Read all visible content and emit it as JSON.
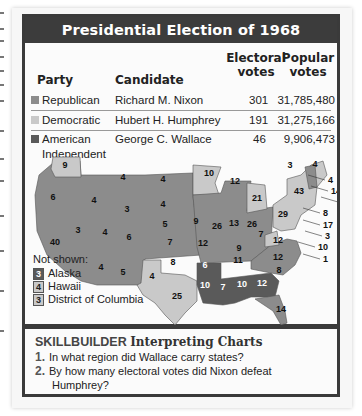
{
  "title": "Presidential Election of 1968",
  "table": {
    "headers": {
      "party": "Party",
      "candidate": "Candidate",
      "electoral_1": "Electoral",
      "electoral_2": "votes",
      "popular_1": "Popular",
      "popular_2": "votes"
    },
    "rows": [
      {
        "party": "Republican",
        "candidate": "Richard M. Nixon",
        "electoral": "301",
        "popular": "31,785,480",
        "color": "#8c8c8c"
      },
      {
        "party": "Democratic",
        "candidate": "Hubert H. Humphrey",
        "electoral": "191",
        "popular": "31,275,166",
        "color": "#c9c9c9"
      },
      {
        "party": "American",
        "party_line2": "Independent",
        "candidate": "George C. Wallace",
        "electoral": "46",
        "popular": "9,906,473",
        "color": "#5a5a5a"
      }
    ]
  },
  "not_shown": {
    "label": "Not shown:",
    "items": [
      {
        "votes": "3",
        "name": "Alaska",
        "party": "Republican"
      },
      {
        "votes": "4",
        "name": "Hawaii",
        "party": "Democratic"
      },
      {
        "votes": "3",
        "name": "District of Columbia",
        "party": "Democratic"
      }
    ]
  },
  "skillbuilder": {
    "label": "SKILLBUILDER",
    "subtitle": "Interpreting Charts",
    "questions": [
      {
        "num": "1.",
        "text": "In what region did Wallace carry states?"
      },
      {
        "num": "2.",
        "text": "By how many electoral votes did Nixon defeat",
        "text2": "Humphrey?"
      }
    ]
  },
  "chart_data": [
    {
      "type": "table",
      "title": "Presidential Election of 1968",
      "columns": [
        "Party",
        "Candidate",
        "Electoral votes",
        "Popular votes"
      ],
      "rows": [
        [
          "Republican",
          "Richard M. Nixon",
          301,
          31785480
        ],
        [
          "Democratic",
          "Hubert H. Humphrey",
          191,
          31275166
        ],
        [
          "American Independent",
          "George C. Wallace",
          46,
          9906473
        ]
      ]
    },
    {
      "type": "map",
      "title": "Electoral votes by state, 1968",
      "legend": {
        "Republican": "#8c8c8c",
        "Democratic": "#c9c9c9",
        "American Independent": "#5a5a5a"
      },
      "states": [
        {
          "state": "WA",
          "votes": 9,
          "party": "Democratic"
        },
        {
          "state": "OR",
          "votes": 6,
          "party": "Republican"
        },
        {
          "state": "CA",
          "votes": 40,
          "party": "Republican"
        },
        {
          "state": "ID",
          "votes": 4,
          "party": "Republican"
        },
        {
          "state": "NV",
          "votes": 3,
          "party": "Republican"
        },
        {
          "state": "MT",
          "votes": 4,
          "party": "Republican"
        },
        {
          "state": "WY",
          "votes": 3,
          "party": "Republican"
        },
        {
          "state": "UT",
          "votes": 4,
          "party": "Republican"
        },
        {
          "state": "AZ",
          "votes": 5,
          "party": "Republican"
        },
        {
          "state": "CO",
          "votes": 6,
          "party": "Republican"
        },
        {
          "state": "NM",
          "votes": 4,
          "party": "Republican"
        },
        {
          "state": "ND",
          "votes": 4,
          "party": "Republican"
        },
        {
          "state": "SD",
          "votes": 4,
          "party": "Republican"
        },
        {
          "state": "NE",
          "votes": 5,
          "party": "Republican"
        },
        {
          "state": "KS",
          "votes": 7,
          "party": "Republican"
        },
        {
          "state": "OK",
          "votes": 8,
          "party": "Republican"
        },
        {
          "state": "TX",
          "votes": 25,
          "party": "Democratic"
        },
        {
          "state": "MN",
          "votes": 10,
          "party": "Democratic"
        },
        {
          "state": "IA",
          "votes": 9,
          "party": "Republican"
        },
        {
          "state": "MO",
          "votes": 12,
          "party": "Republican"
        },
        {
          "state": "AR",
          "votes": 6,
          "party": "American Independent"
        },
        {
          "state": "LA",
          "votes": 10,
          "party": "American Independent"
        },
        {
          "state": "WI",
          "votes": 12,
          "party": "Republican"
        },
        {
          "state": "IL",
          "votes": 26,
          "party": "Republican"
        },
        {
          "state": "MI",
          "votes": 21,
          "party": "Democratic"
        },
        {
          "state": "IN",
          "votes": 13,
          "party": "Republican"
        },
        {
          "state": "OH",
          "votes": 26,
          "party": "Republican"
        },
        {
          "state": "KY",
          "votes": 9,
          "party": "Republican"
        },
        {
          "state": "TN",
          "votes": 11,
          "party": "Republican"
        },
        {
          "state": "MS",
          "votes": 7,
          "party": "American Independent"
        },
        {
          "state": "AL",
          "votes": 10,
          "party": "American Independent"
        },
        {
          "state": "GA",
          "votes": 12,
          "party": "American Independent"
        },
        {
          "state": "FL",
          "votes": 14,
          "party": "Republican"
        },
        {
          "state": "SC",
          "votes": 8,
          "party": "Republican"
        },
        {
          "state": "NC",
          "votes": 12,
          "party": "Republican",
          "note": "1 to Wallace"
        },
        {
          "state": "VA",
          "votes": 12,
          "party": "Republican"
        },
        {
          "state": "WV",
          "votes": 7,
          "party": "Democratic"
        },
        {
          "state": "PA",
          "votes": 29,
          "party": "Democratic"
        },
        {
          "state": "NY",
          "votes": 43,
          "party": "Democratic"
        },
        {
          "state": "VT",
          "votes": 3,
          "party": "Republican"
        },
        {
          "state": "ME",
          "votes": 4,
          "party": "Democratic"
        },
        {
          "state": "NH",
          "votes": 4,
          "party": "Republican"
        },
        {
          "state": "MA",
          "votes": 14,
          "party": "Democratic"
        },
        {
          "state": "RI",
          "votes": 4,
          "party": "Democratic"
        },
        {
          "state": "CT",
          "votes": 8,
          "party": "Democratic"
        },
        {
          "state": "NJ",
          "votes": 17,
          "party": "Republican"
        },
        {
          "state": "DE",
          "votes": 3,
          "party": "Republican"
        },
        {
          "state": "MD",
          "votes": 10,
          "party": "Democratic"
        },
        {
          "state": "AK",
          "votes": 3,
          "party": "Republican"
        },
        {
          "state": "HI",
          "votes": 4,
          "party": "Democratic"
        },
        {
          "state": "DC",
          "votes": 3,
          "party": "Democratic"
        }
      ]
    }
  ],
  "map_labels": [
    {
      "t": "9",
      "x": 40,
      "y": 33
    },
    {
      "t": "6",
      "x": 28,
      "y": 65
    },
    {
      "t": "40",
      "x": 30,
      "y": 110
    },
    {
      "t": "4",
      "x": 69,
      "y": 68
    },
    {
      "t": "3",
      "x": 53,
      "y": 98
    },
    {
      "t": "4",
      "x": 76,
      "y": 135
    },
    {
      "t": "4",
      "x": 98,
      "y": 45
    },
    {
      "t": "3",
      "x": 102,
      "y": 77
    },
    {
      "t": "4",
      "x": 80,
      "y": 100
    },
    {
      "t": "6",
      "x": 104,
      "y": 105
    },
    {
      "t": "5",
      "x": 98,
      "y": 140
    },
    {
      "t": "4",
      "x": 127,
      "y": 144
    },
    {
      "t": "4",
      "x": 138,
      "y": 47
    },
    {
      "t": "4",
      "x": 138,
      "y": 72
    },
    {
      "t": "5",
      "x": 140,
      "y": 92
    },
    {
      "t": "7",
      "x": 145,
      "y": 110
    },
    {
      "t": "8",
      "x": 148,
      "y": 130
    },
    {
      "t": "25",
      "x": 152,
      "y": 164
    },
    {
      "t": "10",
      "x": 184,
      "y": 41
    },
    {
      "t": "9",
      "x": 171,
      "y": 89
    },
    {
      "t": "12",
      "x": 178,
      "y": 111
    },
    {
      "t": "12",
      "x": 210,
      "y": 49
    },
    {
      "t": "26",
      "x": 192,
      "y": 94
    },
    {
      "t": "21",
      "x": 232,
      "y": 66
    },
    {
      "t": "13",
      "x": 209,
      "y": 91
    },
    {
      "t": "26",
      "x": 227,
      "y": 92
    },
    {
      "t": "9",
      "x": 214,
      "y": 116
    },
    {
      "t": "11",
      "x": 213,
      "y": 128
    },
    {
      "t": "6",
      "x": 180,
      "y": 133
    },
    {
      "t": "10",
      "x": 180,
      "y": 153
    },
    {
      "t": "7",
      "x": 198,
      "y": 155
    },
    {
      "t": "10",
      "x": 217,
      "y": 152
    },
    {
      "t": "12",
      "x": 237,
      "y": 151
    },
    {
      "t": "14",
      "x": 256,
      "y": 177
    },
    {
      "t": "8",
      "x": 254,
      "y": 138
    },
    {
      "t": "12",
      "x": 253,
      "y": 125
    },
    {
      "t": "12",
      "x": 253,
      "y": 108
    },
    {
      "t": "7",
      "x": 236,
      "y": 102
    },
    {
      "t": "29",
      "x": 258,
      "y": 82
    },
    {
      "t": "43",
      "x": 274,
      "y": 59
    },
    {
      "t": "3",
      "x": 265,
      "y": 33
    },
    {
      "t": "4",
      "x": 290,
      "y": 32
    }
  ],
  "map_callouts": [
    {
      "t": "4",
      "x": 303,
      "y": 48
    },
    {
      "t": "14",
      "x": 306,
      "y": 59
    },
    {
      "t": "4",
      "x": 316,
      "y": 70
    },
    {
      "t": "8",
      "x": 298,
      "y": 81
    },
    {
      "t": "17",
      "x": 298,
      "y": 93
    },
    {
      "t": "3",
      "x": 300,
      "y": 104
    },
    {
      "t": "10",
      "x": 293,
      "y": 115
    },
    {
      "t": "1",
      "x": 298,
      "y": 127
    }
  ]
}
